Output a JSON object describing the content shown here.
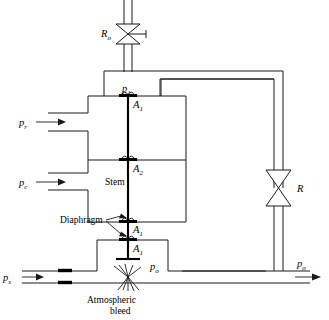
{
  "figure": {
    "kind": "pneumatic-controller-schematic",
    "background_color": "#ffffff",
    "line_color": "#1a1a1a"
  },
  "labels": {
    "valve_top": "R",
    "valve_top_sub": "o",
    "valve_right": "R",
    "pressure_top_chamber": "p",
    "pressure_top_chamber_sub": "1",
    "area_1_top": "A",
    "area_1_top_sub": "1",
    "area_2": "A",
    "area_2_sub": "2",
    "area_1_mid": "A",
    "area_1_mid_sub": "1",
    "area_1_low": "A",
    "area_1_low_sub": "1",
    "inlet_reference": "p",
    "inlet_reference_sub": "r",
    "inlet_control": "p",
    "inlet_control_sub": "c",
    "supply": "p",
    "supply_sub": "s",
    "output_inner": "p",
    "output_inner_sub": "o",
    "output_right": "p",
    "output_right_sub": "o",
    "stem": "Stem",
    "diaphragm": "Diaphragm",
    "bleed_line1": "Atmospheric",
    "bleed_line2": "bleed"
  },
  "icons": {
    "valve_top": "valve-bowtie-icon",
    "valve_top_handle": "valve-handle-icon",
    "valve_right": "valve-bowtie-icon",
    "arrow_pr": "flow-arrow-right-icon",
    "arrow_pc": "flow-arrow-right-icon",
    "arrow_ps": "flow-arrow-right-icon",
    "arrow_po": "flow-arrow-right-icon",
    "bleed": "atmospheric-bleed-icon",
    "restriction": "pipe-restriction-icon",
    "plug": "valve-plug-icon"
  }
}
